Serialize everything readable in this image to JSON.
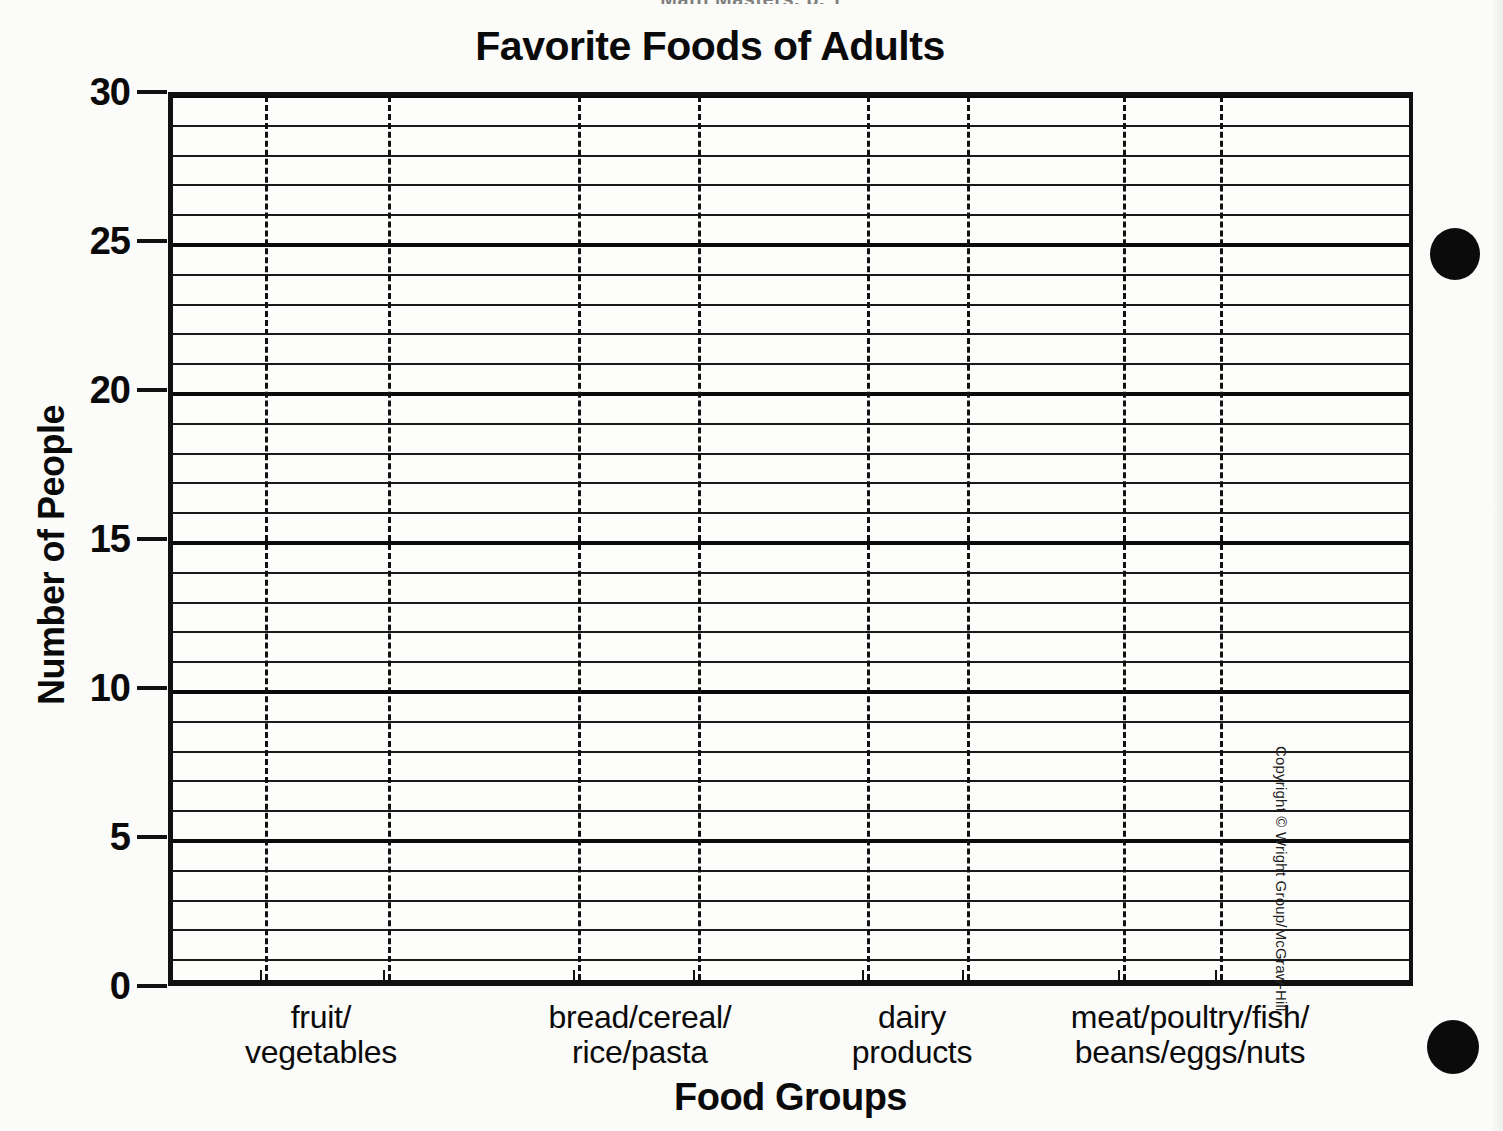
{
  "page": {
    "top_fragment": "Math Masters, p. 1",
    "copyright": "Copyright © Wright Group/McGraw-Hill"
  },
  "chart_data": {
    "type": "bar",
    "title": "Favorite Foods of Adults",
    "xlabel": "Food Groups",
    "ylabel": "Number of People",
    "categories": [
      "fruit/\nvegetables",
      "bread/cereal/\nrice/pasta",
      "dairy\nproducts",
      "meat/poultry/fish/\nbeans/eggs/nuts"
    ],
    "category_lines": [
      [
        "fruit/",
        "vegetables"
      ],
      [
        "bread/cereal/",
        "rice/pasta"
      ],
      [
        "dairy",
        "products"
      ],
      [
        "meat/poultry/fish/",
        "beans/eggs/nuts"
      ]
    ],
    "values": [
      null,
      null,
      null,
      null
    ],
    "ylim": [
      0,
      30
    ],
    "y_major_ticks": [
      0,
      5,
      10,
      15,
      20,
      25,
      30
    ],
    "y_minor_step": 1,
    "grid": true,
    "grid_major_every": 5,
    "vertical_divider_count": 8,
    "column_count": 9,
    "legend": null,
    "note": "blank grid template — no bars drawn"
  },
  "colors": {
    "ink": "#0a0a0a",
    "grid": "#1a1a1a",
    "paper": "#fbfbf9",
    "dot": "#0b0b0b"
  },
  "marks": {
    "punch_dot_top": "punch-dot",
    "punch_dot_bottom": "punch-dot"
  }
}
